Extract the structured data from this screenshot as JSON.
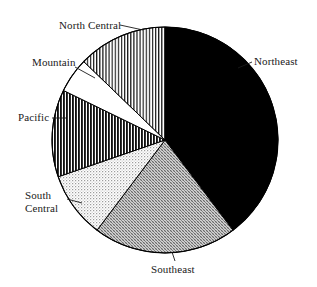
{
  "chart_data": {
    "type": "pie",
    "title": "",
    "subtitle": "",
    "xlabel": "",
    "ylabel": "",
    "legend_position": "none",
    "grid": false,
    "label_placement": "outside-callout",
    "start_angle_deg": 0,
    "direction": "clockwise",
    "center": {
      "x": 165,
      "y": 140
    },
    "radius": 113,
    "categories": [
      "Northeast",
      "Southeast",
      "South Central",
      "Pacific",
      "Mountain",
      "North Central"
    ],
    "values": [
      39.7,
      20.6,
      9.4,
      12.5,
      5.0,
      12.8
    ],
    "units": "percent",
    "slices": [
      {
        "label": "Northeast",
        "value": 39.7,
        "start_angle_deg": 0,
        "end_angle_deg": 143,
        "fill": "solid-black",
        "color": "#000000"
      },
      {
        "label": "Southeast",
        "value": 20.6,
        "start_angle_deg": 143,
        "end_angle_deg": 217,
        "fill": "crosshatch-medium",
        "color": "#a8a8a8"
      },
      {
        "label": "South Central",
        "value": 9.4,
        "start_angle_deg": 217,
        "end_angle_deg": 251,
        "fill": "dotted-light",
        "color": "#d0d0d0"
      },
      {
        "label": "Pacific",
        "value": 12.5,
        "start_angle_deg": 251,
        "end_angle_deg": 296,
        "fill": "vertical-stripes-dense",
        "color": "#303030"
      },
      {
        "label": "Mountain",
        "value": 5.0,
        "start_angle_deg": 296,
        "end_angle_deg": 314,
        "fill": "white",
        "color": "#ffffff"
      },
      {
        "label": "North Central",
        "value": 12.8,
        "start_angle_deg": 314,
        "end_angle_deg": 360,
        "fill": "vertical-stripes-light",
        "color": "#5a5a5a"
      }
    ],
    "labels": {
      "north_central": "North Central",
      "mountain": "Mountain",
      "pacific": "Pacific",
      "south_central_line1": "South",
      "south_central_line2": "Central",
      "northeast": "Northeast",
      "southeast": "Southeast"
    },
    "colors": {
      "outline": "#000000",
      "background": "#ffffff",
      "text": "#1a1a1a"
    }
  }
}
